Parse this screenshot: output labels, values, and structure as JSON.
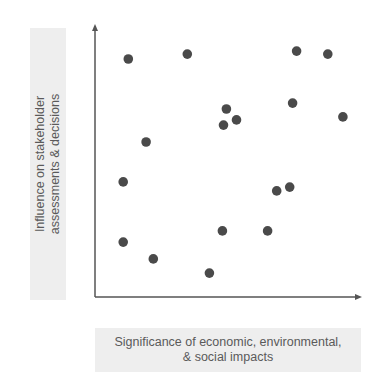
{
  "chart_data": {
    "type": "scatter",
    "title": "",
    "xlabel": "Significance of economic, environmental, & social impacts",
    "ylabel": "Influence on stakeholder assessments & decisions",
    "xlabel_lines": [
      "Significance of economic, environmental,",
      "& social impacts"
    ],
    "ylabel_lines": [
      "Influence on stakeholder",
      "assessments & decisions"
    ],
    "xlim": [
      0,
      100
    ],
    "ylim": [
      0,
      100
    ],
    "grid": false,
    "ticks": false,
    "legend": null,
    "points": [
      {
        "x": 12.5,
        "y": 87.5
      },
      {
        "x": 34.7,
        "y": 89.3
      },
      {
        "x": 75.8,
        "y": 90.4
      },
      {
        "x": 87.5,
        "y": 89.3
      },
      {
        "x": 49.4,
        "y": 69.1
      },
      {
        "x": 48.3,
        "y": 63.2
      },
      {
        "x": 53.2,
        "y": 65.1
      },
      {
        "x": 74.3,
        "y": 71.3
      },
      {
        "x": 93.2,
        "y": 66.2
      },
      {
        "x": 19.2,
        "y": 57.0
      },
      {
        "x": 10.6,
        "y": 42.3
      },
      {
        "x": 68.3,
        "y": 39.0
      },
      {
        "x": 73.2,
        "y": 40.4
      },
      {
        "x": 10.6,
        "y": 20.2
      },
      {
        "x": 21.9,
        "y": 14.0
      },
      {
        "x": 47.9,
        "y": 24.3
      },
      {
        "x": 64.9,
        "y": 24.3
      },
      {
        "x": 43.0,
        "y": 8.8
      }
    ]
  },
  "colors": {
    "point": "#4a4a4a",
    "axis": "#555555",
    "label_text": "#5a5a5a",
    "label_bg": "#eeeeee"
  }
}
